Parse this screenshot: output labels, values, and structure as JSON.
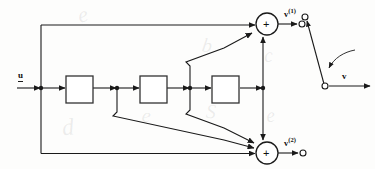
{
  "figure": {
    "type": "block-diagram",
    "background_color": "#fdfdfc",
    "line_color": "#1a1a1a",
    "labels": {
      "input": "u",
      "output_top_base": "v",
      "output_top_sup": "(1)",
      "output_bottom_base": "v",
      "output_bottom_sup": "(2)",
      "output_switch": "v",
      "summer_sign_top": "+",
      "summer_sign_bottom": "+"
    },
    "blocks": [
      {
        "name": "block-1",
        "label": "",
        "x": 66,
        "y": 76,
        "w": 27,
        "h": 27
      },
      {
        "name": "block-2",
        "label": "",
        "x": 140,
        "y": 76,
        "w": 27,
        "h": 27
      },
      {
        "name": "block-3",
        "label": "",
        "x": 212,
        "y": 76,
        "w": 27,
        "h": 27
      }
    ],
    "summers": [
      {
        "name": "summer-top",
        "cx": 267,
        "cy": 24,
        "r": 11,
        "sign": "+"
      },
      {
        "name": "summer-bottom",
        "cx": 267,
        "cy": 153,
        "r": 11,
        "sign": "+"
      }
    ],
    "terminals": [
      {
        "name": "terminal-v1",
        "cx": 302,
        "cy": 24,
        "r": 3
      },
      {
        "name": "terminal-v2",
        "cx": 303,
        "cy": 153,
        "r": 3
      },
      {
        "name": "switch-contact-upper",
        "cx": 305,
        "cy": 17,
        "r": 3
      },
      {
        "name": "switch-pivot",
        "cx": 325,
        "cy": 86,
        "r": 3
      }
    ],
    "junction_dots": [
      {
        "name": "junction-input",
        "cx": 41,
        "cy": 88
      },
      {
        "name": "junction-mid",
        "cx": 117,
        "cy": 88
      },
      {
        "name": "junction-right",
        "cx": 190,
        "cy": 88
      },
      {
        "name": "junction-feed",
        "cx": 263,
        "cy": 88
      }
    ],
    "watermarks": [
      {
        "text": "e",
        "x": 78,
        "y": 6,
        "size": 22,
        "rotate": -12
      },
      {
        "text": "b",
        "x": 202,
        "y": 38,
        "size": 20,
        "rotate": 8
      },
      {
        "text": "c",
        "x": 265,
        "y": 48,
        "size": 20,
        "rotate": -5
      },
      {
        "text": "e",
        "x": 142,
        "y": 108,
        "size": 20,
        "rotate": 6
      },
      {
        "text": "S",
        "x": 206,
        "y": 104,
        "size": 20,
        "rotate": 4
      },
      {
        "text": "e",
        "x": 267,
        "y": 108,
        "size": 20,
        "rotate": -8
      },
      {
        "text": "d",
        "x": 63,
        "y": 118,
        "size": 24,
        "rotate": -6
      }
    ]
  }
}
